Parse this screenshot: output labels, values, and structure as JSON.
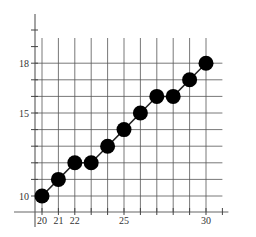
{
  "chart_data": {
    "type": "scatter",
    "title": "",
    "xlabel": "",
    "ylabel": "",
    "x": [
      20,
      21,
      22,
      23,
      24,
      25,
      26,
      27,
      28,
      29,
      30
    ],
    "y": [
      10,
      11,
      12,
      12,
      13,
      14,
      15,
      16,
      16,
      17,
      18
    ],
    "connected": true,
    "xlim": [
      19.5,
      31.5
    ],
    "ylim": [
      9.5,
      19.9
    ],
    "x_tick_labels": [
      {
        "value": 20,
        "label": "20"
      },
      {
        "value": 21,
        "label": "21"
      },
      {
        "value": 22,
        "label": "22"
      },
      {
        "value": 25,
        "label": "25"
      },
      {
        "value": 30,
        "label": "30"
      }
    ],
    "y_tick_labels": [
      {
        "value": 10,
        "label": "10"
      },
      {
        "value": 15,
        "label": "15"
      },
      {
        "value": 18,
        "label": "18"
      }
    ],
    "x_ticks": [
      20,
      21,
      22,
      23,
      24,
      25,
      26,
      27,
      28,
      29,
      30,
      31
    ],
    "y_ticks": [
      10,
      11,
      12,
      13,
      14,
      15,
      16,
      17,
      18,
      19,
      20
    ],
    "grid": true,
    "legend": null,
    "colors": {
      "point": "#000000",
      "line": "#222222",
      "grid": "#555555",
      "axis": "#666666"
    }
  }
}
